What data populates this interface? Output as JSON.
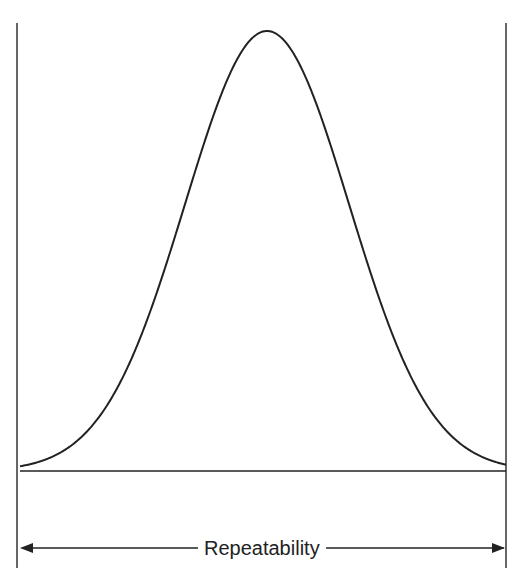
{
  "diagram": {
    "dimension_label": "Repeatability",
    "curve": {
      "type": "normal-distribution",
      "center_x": 267,
      "sigma_px": 82,
      "baseline_y": 471,
      "peak_y": 31,
      "x_start": 20,
      "x_end": 506
    },
    "colors": {
      "line": "#222222",
      "background": "#ffffff"
    }
  }
}
